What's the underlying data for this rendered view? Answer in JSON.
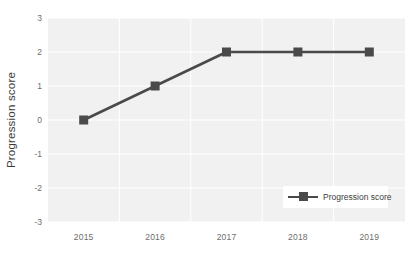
{
  "chart_data": {
    "type": "line",
    "title": "",
    "subtitle": "",
    "xlabel": "",
    "ylabel": "Progression score",
    "categories": [
      "2015",
      "2016",
      "2017",
      "2018",
      "2019"
    ],
    "x": [
      2015,
      2016,
      2017,
      2018,
      2019
    ],
    "series": [
      {
        "name": "Progression score",
        "values": [
          0,
          1,
          2,
          2,
          2
        ],
        "color": "#4a4a4a",
        "marker": "square"
      }
    ],
    "ylim": [
      -3,
      3
    ],
    "yticks": [
      3,
      2,
      1,
      0,
      -1,
      -2,
      -3
    ],
    "ytick_labels": [
      "3",
      "2",
      "1",
      "0",
      "-1",
      "-2",
      "-3"
    ],
    "xtick_labels": [
      "2015",
      "2016",
      "2017",
      "2018",
      "2019"
    ],
    "grid": true,
    "grid_color": "#ffffff",
    "plot_background": "#f1f1f1",
    "figure_background": "#ffffff",
    "legend": {
      "position": "lower right",
      "entries": [
        "Progression score"
      ],
      "background": "#ffffff"
    }
  }
}
